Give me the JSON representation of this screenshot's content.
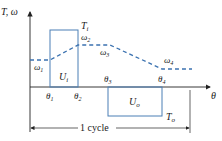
{
  "diagram": {
    "colors": {
      "torque_line": "#4a7fb5",
      "velocity_dash": "#3b72b0",
      "axis": "#222222",
      "text": "#1a1a1a"
    },
    "axes": {
      "y_label": "T, ω",
      "x_label": "θ"
    },
    "torque": {
      "input_label": "T",
      "input_sub": "i",
      "output_label": "T",
      "output_sub": "o"
    },
    "energy": {
      "input_label": "U",
      "input_sub": "i",
      "output_label": "U",
      "output_sub": "o"
    },
    "angles": [
      {
        "sym": "θ",
        "sub": "1"
      },
      {
        "sym": "θ",
        "sub": "2"
      },
      {
        "sym": "θ",
        "sub": "3"
      },
      {
        "sym": "θ",
        "sub": "4"
      }
    ],
    "velocities": [
      {
        "sym": "ω",
        "sub": "1"
      },
      {
        "sym": "ω",
        "sub": "2"
      },
      {
        "sym": "ω",
        "sub": "3"
      },
      {
        "sym": "ω",
        "sub": "4"
      }
    ],
    "cycle_label": "1 cycle"
  }
}
